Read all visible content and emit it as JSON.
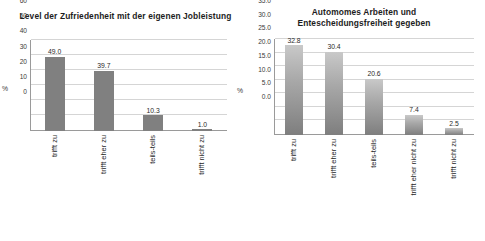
{
  "chart_data": [
    {
      "type": "bar",
      "panel": "left",
      "title": "Level der Zufriedenheit mit der eigenen Jobleistung",
      "title_lines": [
        "Level der Zufriedenheit mit der eigenen Jobleistung"
      ],
      "categories": [
        "trifft zu",
        "trifft eher zu",
        "teils-teils",
        "trifft nicht zu"
      ],
      "values": [
        49.0,
        39.7,
        10.3,
        1.0
      ],
      "value_labels": [
        "49.0",
        "39.7",
        "10.3",
        "1.0"
      ],
      "xlabel": "",
      "ylabel": "%",
      "ylim": [
        0,
        60
      ],
      "yticks": [
        0,
        10,
        20,
        30,
        40,
        50,
        60
      ],
      "ytick_labels": [
        "0",
        "10",
        "20",
        "30",
        "40",
        "50",
        "60"
      ],
      "grid": "horizontal",
      "legend": "none",
      "bar_color": "#808080",
      "bar_style": "solid"
    },
    {
      "type": "bar",
      "panel": "right",
      "title": "Automomes Arbeiten und Entescheidungsfreiheit gegeben",
      "title_lines": [
        "Automomes Arbeiten und",
        "Entescheidungsfreiheit gegeben"
      ],
      "categories": [
        "trifft zu",
        "trifft eher zu",
        "teils-teils",
        "trifft eher nicht zu",
        "trifft nicht zu"
      ],
      "values": [
        32.8,
        30.4,
        20.6,
        7.4,
        2.5
      ],
      "value_labels": [
        "32.8",
        "30.4",
        "20.6",
        "7.4",
        "2.5"
      ],
      "xlabel": "",
      "ylabel": "%",
      "ylim": [
        0,
        35
      ],
      "yticks": [
        0,
        5,
        10,
        15,
        20,
        25,
        30,
        35
      ],
      "ytick_labels": [
        "0.0",
        "5.0",
        "10.0",
        "15.0",
        "20.0",
        "25.0",
        "30.0",
        "35.0"
      ],
      "grid": "horizontal",
      "legend": "none",
      "bar_color": "#a0a0a0",
      "bar_style": "gradient"
    }
  ]
}
